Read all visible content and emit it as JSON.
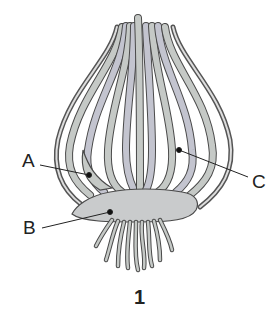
{
  "diagram": {
    "figure_number": "1",
    "labels": [
      {
        "id": "A",
        "text": "A",
        "target": "bud"
      },
      {
        "id": "B",
        "text": "B",
        "target": "basal stem disc"
      },
      {
        "id": "C",
        "text": "C",
        "target": "fleshy scale leaf"
      }
    ],
    "colors": {
      "fill": "#c5c9c6",
      "fill_alt": "#c3c4cf",
      "outline": "#4a4a4a",
      "outer_skin": "#555555",
      "leader_line": "#222222",
      "background": "#ffffff"
    }
  }
}
